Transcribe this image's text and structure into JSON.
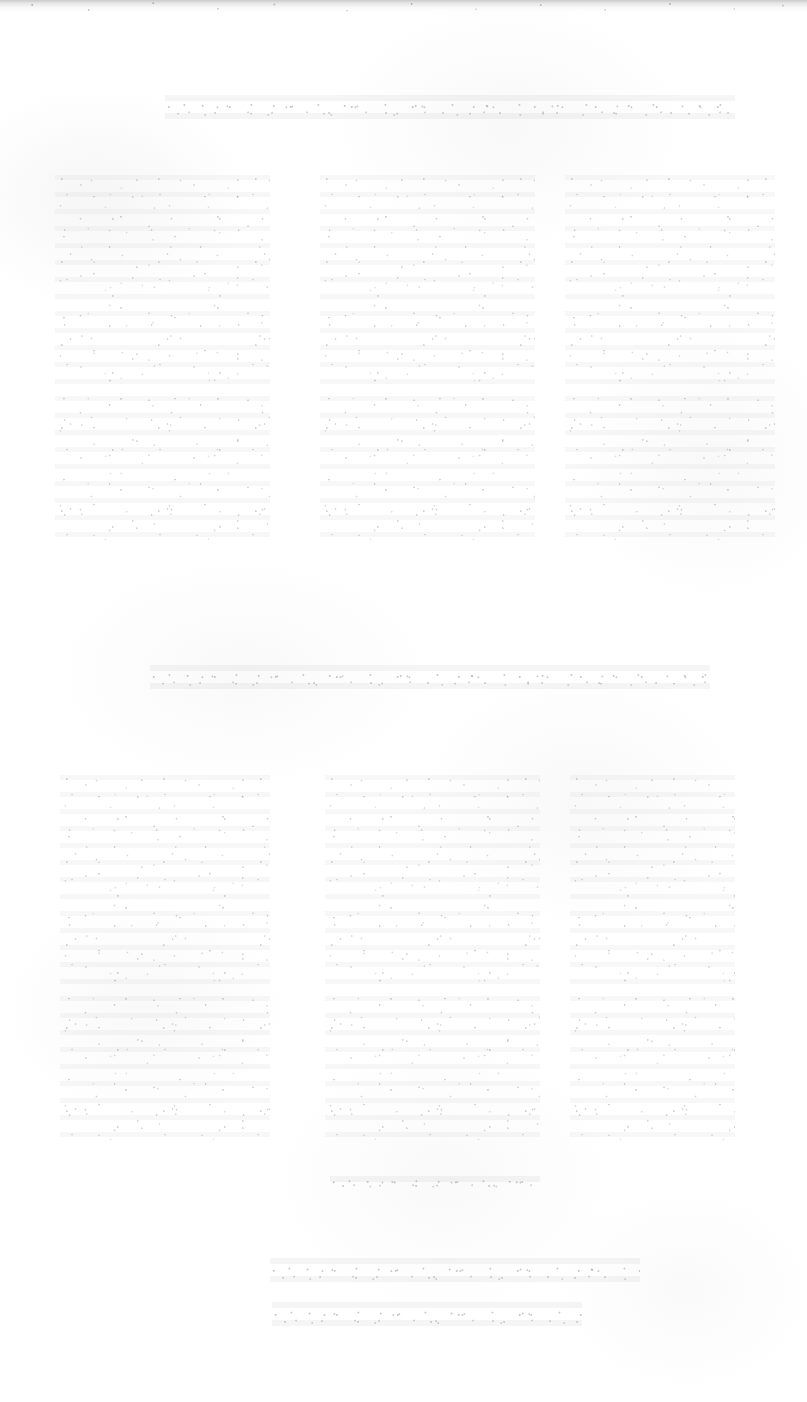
{
  "page": {
    "width": 807,
    "height": 1402,
    "background_color": "#ffffff",
    "condition": "severely faded / bleached scan — no glyph is legible at any magnification",
    "ink_color": "#60626a"
  },
  "artifacts": {
    "top_scan_edge": {
      "name": "scan-edge-band",
      "x": 0,
      "y": 0,
      "width": 807,
      "height": 16,
      "color": "#969698"
    }
  },
  "sections": [
    {
      "id": "heading-upper",
      "kind": "heading-line",
      "text": "",
      "legible": false,
      "x": 165,
      "y": 95,
      "width": 570,
      "height": 30
    },
    {
      "id": "section-upper",
      "kind": "three-column-body",
      "y": 175,
      "height": 370,
      "columns": [
        {
          "id": "upper-col-1",
          "text": "",
          "legible": false,
          "x": 55,
          "y": 175,
          "width": 215,
          "height": 370
        },
        {
          "id": "upper-col-2",
          "text": "",
          "legible": false,
          "x": 320,
          "y": 175,
          "width": 215,
          "height": 370
        },
        {
          "id": "upper-col-3",
          "text": "",
          "legible": false,
          "x": 565,
          "y": 175,
          "width": 210,
          "height": 370
        }
      ]
    },
    {
      "id": "heading-lower",
      "kind": "heading-line",
      "text": "",
      "legible": false,
      "x": 150,
      "y": 665,
      "width": 560,
      "height": 30
    },
    {
      "id": "section-lower",
      "kind": "three-column-body",
      "y": 775,
      "height": 365,
      "columns": [
        {
          "id": "lower-col-1",
          "text": "",
          "legible": false,
          "x": 60,
          "y": 775,
          "width": 210,
          "height": 365
        },
        {
          "id": "lower-col-2",
          "text": "",
          "legible": false,
          "x": 325,
          "y": 775,
          "width": 215,
          "height": 365
        },
        {
          "id": "lower-col-3",
          "text": "",
          "legible": false,
          "x": 570,
          "y": 775,
          "width": 165,
          "height": 365
        }
      ]
    },
    {
      "id": "stray-line",
      "kind": "short-line",
      "text": "",
      "legible": false,
      "x": 330,
      "y": 1176,
      "width": 210,
      "height": 16
    }
  ],
  "footer": {
    "lines": [
      {
        "id": "footer-line-1",
        "text": "",
        "legible": false,
        "x": 270,
        "y": 1258,
        "width": 370,
        "height": 32
      },
      {
        "id": "footer-line-2",
        "text": "",
        "legible": false,
        "x": 272,
        "y": 1302,
        "width": 310,
        "height": 32
      }
    ]
  }
}
